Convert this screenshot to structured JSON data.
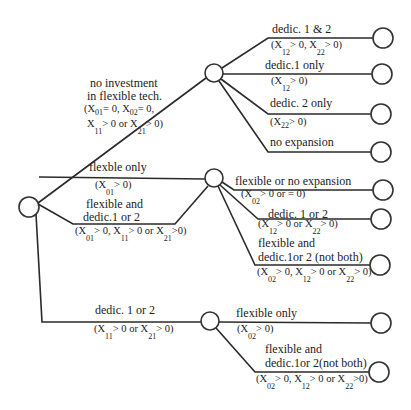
{
  "diagram": {
    "type": "decision-tree",
    "nodes": {
      "root": {
        "cx": 29,
        "cy": 207,
        "r": 10
      },
      "a": {
        "cx": 214,
        "cy": 73,
        "r": 9
      },
      "b": {
        "cx": 214,
        "cy": 178,
        "r": 9
      },
      "c": {
        "cx": 210,
        "cy": 321,
        "r": 9
      },
      "leaves": [
        {
          "id": "a1",
          "cx": 383,
          "cy": 38
        },
        {
          "id": "a2",
          "cx": 382,
          "cy": 74
        },
        {
          "id": "a3",
          "cx": 381,
          "cy": 114
        },
        {
          "id": "a4",
          "cx": 381,
          "cy": 152
        },
        {
          "id": "b1",
          "cx": 383,
          "cy": 190
        },
        {
          "id": "b2",
          "cx": 381,
          "cy": 219
        },
        {
          "id": "b3",
          "cx": 380,
          "cy": 265
        },
        {
          "id": "c1",
          "cx": 381,
          "cy": 323
        },
        {
          "id": "c2",
          "cx": 379,
          "cy": 372
        }
      ]
    },
    "first_stage": {
      "no_investment": {
        "line1": "no investment",
        "line2": "in flexible tech.",
        "cond1": "(X",
        "cond1_sub1": "01",
        "cond1_b": "= 0, X",
        "cond1_sub2": "02",
        "cond1_c": "= 0,",
        "cond2_a": "X",
        "cond2_sub1": "11",
        "cond2_b": "> 0 or X",
        "cond2_sub2": "21",
        "cond2_c": "> 0)"
      },
      "flexible_only": {
        "label": "flexble only",
        "cond_a": "(X",
        "cond_sub": "01",
        "cond_b": "> 0)"
      },
      "flexible_and_dedic": {
        "line1": "flexible and",
        "line2": "dedic.1 or 2",
        "cond_a": "(X",
        "sub1": "01",
        "cond_b": "> 0, X",
        "sub2": "11",
        "cond_c": "> 0 or X",
        "sub3": "21",
        "cond_d": ">0)"
      },
      "dedic_1_or_2": {
        "label": "dedic. 1 or 2",
        "cond_a": "(X",
        "sub1": "11",
        "cond_b": "> 0 or X",
        "sub2": "21",
        "cond_c": "> 0)"
      }
    },
    "second_stage_a": {
      "dedic_1_and_2": {
        "label": "dedic. 1 & 2",
        "cond_a": "(X",
        "sub1": "12",
        "cond_b": "> 0, X",
        "sub2": "22",
        "cond_c": "> 0)"
      },
      "dedic_1_only": {
        "label": "dedic.1 only",
        "cond_a": "(X",
        "sub1": "12",
        "cond_b": "> 0)"
      },
      "dedic_2_only": {
        "label": "dedic. 2 only",
        "cond_a": "(X",
        "sub1": "22",
        "cond_b": "> 0)"
      },
      "no_expansion": {
        "label": "no expansion"
      }
    },
    "second_stage_b": {
      "flexible_or_no_expansion": {
        "label": "flexible or no expansion",
        "cond_a": "(X",
        "sub1": "02",
        "cond_b": "> 0 or = 0)"
      },
      "dedic_1_or_2": {
        "label": "dedic. 1 or 2",
        "cond_a": "(X",
        "sub1": "12",
        "cond_b": "> 0 or X",
        "sub2": "22",
        "cond_c": "> 0)"
      },
      "flexible_and_dedic": {
        "line1": "flexible and",
        "line2": "dedic.1or 2 (not both)",
        "cond_a": "(X",
        "sub1": "02",
        "cond_b": "> 0, X",
        "sub2": "12",
        "cond_c": "> 0 or X",
        "sub3": "22",
        "cond_d": "> 0)"
      }
    },
    "second_stage_c": {
      "flexible_only": {
        "label": "flexible only",
        "cond_a": "(X",
        "sub1": "02",
        "cond_b": "> 0)"
      },
      "flexible_and_dedic": {
        "line1": "flexible and",
        "line2": "dedic.1or 2(not both)",
        "cond_a": "(X",
        "sub1": "02",
        "cond_b": "> 0, X",
        "sub2": "12",
        "cond_c": "> 0 or X",
        "sub3": "22",
        "cond_d": ">0)"
      }
    },
    "colors": {
      "line": "#2a2a2a",
      "text": "#222222",
      "background": "#ffffff"
    }
  }
}
